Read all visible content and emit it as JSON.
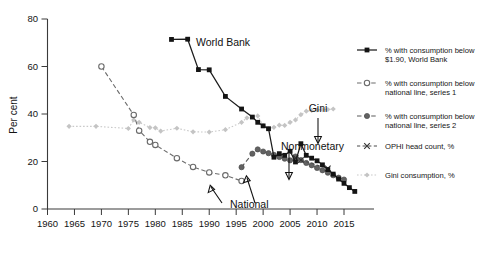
{
  "chart_data": {
    "type": "line",
    "title": "",
    "xlabel": "",
    "ylabel": "Per cent",
    "xlim": [
      1958,
      2017
    ],
    "ylim": [
      0,
      80
    ],
    "xticks": [
      1960,
      1965,
      1970,
      1975,
      1980,
      1985,
      1990,
      1995,
      2000,
      2005,
      2010,
      2015
    ],
    "yticks": [
      0,
      20,
      40,
      60,
      80
    ],
    "grid": false,
    "legend_position": "right",
    "series": [
      {
        "name": "% with consumption below $1.90, World Bank",
        "key": "world_bank",
        "color": "#141414",
        "marker": "filled-square",
        "linestyle": "solid",
        "points": [
          [
            1983,
            71.4
          ],
          [
            1986,
            71.5
          ],
          [
            1988,
            58.7
          ],
          [
            1990,
            58.6
          ],
          [
            1993,
            47.4
          ],
          [
            1996,
            42.1
          ],
          [
            1998,
            38.7
          ],
          [
            1999,
            36.5
          ],
          [
            2000,
            35.0
          ],
          [
            2001,
            33.8
          ],
          [
            2002,
            21.8
          ],
          [
            2003,
            23.3
          ],
          [
            2004,
            22.6
          ],
          [
            2005,
            24.3
          ],
          [
            2006,
            19.8
          ],
          [
            2007,
            27.5
          ],
          [
            2008,
            22.6
          ],
          [
            2009,
            21.4
          ],
          [
            2010,
            20.3
          ],
          [
            2011,
            18.6
          ],
          [
            2012,
            16.6
          ],
          [
            2013,
            14.7
          ],
          [
            2014,
            12.6
          ],
          [
            2015,
            10.8
          ],
          [
            2016,
            9.0
          ],
          [
            2017,
            7.4
          ]
        ]
      },
      {
        "name": "% with consumption below national line, series 1",
        "key": "national_1",
        "color": "#6d6d6d",
        "marker": "open-circle",
        "linestyle": "dashed",
        "points": [
          [
            1970,
            60.0
          ],
          [
            1976,
            39.6
          ],
          [
            1977,
            33.0
          ],
          [
            1979,
            28.3
          ],
          [
            1980,
            27.0
          ],
          [
            1984,
            21.4
          ],
          [
            1987,
            17.7
          ],
          [
            1990,
            15.4
          ],
          [
            1993,
            14.2
          ],
          [
            1996,
            11.8
          ]
        ]
      },
      {
        "name": "% with consumption below national line, series 2",
        "key": "national_2",
        "color": "#5e5e5e",
        "marker": "filled-circle",
        "linestyle": "dashed",
        "points": [
          [
            1996,
            17.6
          ],
          [
            1998,
            23.3
          ],
          [
            1999,
            25.1
          ],
          [
            2000,
            24.2
          ],
          [
            2001,
            23.5
          ],
          [
            2002,
            22.8
          ],
          [
            2003,
            21.9
          ],
          [
            2004,
            21.2
          ],
          [
            2005,
            20.5
          ],
          [
            2006,
            22.1
          ],
          [
            2007,
            20.6
          ],
          [
            2008,
            19.4
          ],
          [
            2009,
            18.4
          ],
          [
            2010,
            17.3
          ],
          [
            2011,
            16.3
          ],
          [
            2012,
            15.3
          ],
          [
            2013,
            14.2
          ],
          [
            2014,
            13.2
          ],
          [
            2015,
            12.4
          ]
        ]
      },
      {
        "name": "OPHI head count, %",
        "key": "ophi",
        "color": "#3f3f3f",
        "marker": "x",
        "linestyle": "dashed",
        "points": [
          [
            2006,
            21.5
          ],
          [
            2007,
            20.6
          ],
          [
            2012,
            17.1
          ]
        ]
      },
      {
        "name": "Gini consumption, %",
        "key": "gini",
        "color": "#c4c4c4",
        "marker": "diamond",
        "linestyle": "dotted",
        "points": [
          [
            1964,
            34.8
          ],
          [
            1969,
            34.8
          ],
          [
            1975,
            33.9
          ],
          [
            1976,
            37.5
          ],
          [
            1977,
            36.5
          ],
          [
            1979,
            34.3
          ],
          [
            1980,
            34.2
          ],
          [
            1981,
            32.8
          ],
          [
            1984,
            34.0
          ],
          [
            1987,
            32.5
          ],
          [
            1990,
            32.4
          ],
          [
            1993,
            33.4
          ],
          [
            1996,
            36.5
          ],
          [
            1997,
            38.4
          ],
          [
            1999,
            39.2
          ],
          [
            2000,
            35.1
          ],
          [
            2001,
            33.8
          ],
          [
            2002,
            34.4
          ],
          [
            2003,
            35.3
          ],
          [
            2004,
            35.2
          ],
          [
            2005,
            36.5
          ],
          [
            2006,
            37.5
          ],
          [
            2007,
            39.7
          ],
          [
            2008,
            41.2
          ],
          [
            2009,
            41.5
          ],
          [
            2010,
            41.7
          ],
          [
            2011,
            41.8
          ],
          [
            2012,
            41.9
          ],
          [
            2013,
            42.1
          ]
        ]
      }
    ],
    "annotations": [
      {
        "text": "World Bank",
        "key": "world_bank_label"
      },
      {
        "text": "Gini",
        "key": "gini_label"
      },
      {
        "text": "Nonmonetary",
        "key": "nonmonetary_label"
      },
      {
        "text": "National",
        "key": "national_label"
      }
    ]
  },
  "axis": {
    "ylabel": "Per cent",
    "ytick_labels": [
      "0",
      "20",
      "40",
      "60",
      "80"
    ],
    "xtick_labels": [
      "1960",
      "1965",
      "1970",
      "1975",
      "1980",
      "1985",
      "1990",
      "1995",
      "2000",
      "2005",
      "2010",
      "2015"
    ]
  },
  "legend": {
    "items": [
      {
        "line1": "% with consumption below",
        "line2": "$1.90, World Bank",
        "marker": "filled-square"
      },
      {
        "line1": "% with consumption below",
        "line2": "national line, series 1",
        "marker": "open-circle"
      },
      {
        "line1": "% with consumption below",
        "line2": "national line, series 2",
        "marker": "filled-circle"
      },
      {
        "line1": "OPHI head count, %",
        "line2": "",
        "marker": "x"
      },
      {
        "line1": "Gini consumption, %",
        "line2": "",
        "marker": "diamond"
      }
    ]
  },
  "annotations": {
    "world_bank": "World Bank",
    "gini": "Gini",
    "nonmonetary": "Nonmonetary",
    "national": "National"
  },
  "colors": {
    "world_bank": "#141414",
    "national_1": "#6d6d6d",
    "national_2": "#5e5e5e",
    "ophi": "#3f3f3f",
    "gini": "#c4c4c4",
    "axis": "#3a3a3a",
    "background": "#ffffff"
  }
}
